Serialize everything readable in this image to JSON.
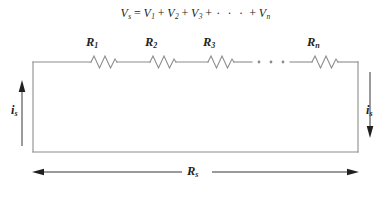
{
  "figure": {
    "kind": "series-resistor-circuit-diagram",
    "background_color": "#ffffff",
    "ink_color": "#231f20",
    "wire_color": "#8c8c8c"
  },
  "equation": {
    "lhs_symbol": "V",
    "lhs_subscript": "s",
    "equals": "=",
    "terms": [
      {
        "symbol": "V",
        "subscript": "1"
      },
      {
        "symbol": "V",
        "subscript": "2"
      },
      {
        "symbol": "V",
        "subscript": "3"
      }
    ],
    "plus": "+",
    "ellipsis": "· · ·",
    "last_term": {
      "symbol": "V",
      "subscript": "n"
    },
    "plain_text": "Vs = V1 + V2 + V3 + ··· + Vn"
  },
  "resistors": [
    {
      "id": "r1",
      "symbol": "R",
      "subscript": "1",
      "label_x": 86,
      "label_y": 35,
      "zigzag_center_x": 104
    },
    {
      "id": "r2",
      "symbol": "R",
      "subscript": "2",
      "label_x": 145,
      "label_y": 35,
      "zigzag_center_x": 163
    },
    {
      "id": "r3",
      "symbol": "R",
      "subscript": "3",
      "label_x": 203,
      "label_y": 35,
      "zigzag_center_x": 221
    },
    {
      "id": "rn",
      "symbol": "R",
      "subscript": "n",
      "label_x": 307,
      "label_y": 35,
      "zigzag_center_x": 325
    }
  ],
  "currents": [
    {
      "id": "i-left",
      "symbol": "i",
      "subscript": "s",
      "direction": "up",
      "label_x": 11,
      "label_y": 103
    },
    {
      "id": "i-right",
      "symbol": "i",
      "subscript": "s",
      "direction": "down",
      "label_x": 366,
      "label_y": 103
    }
  ],
  "total_resistance": {
    "symbol": "R",
    "subscript": "s",
    "label_x": 187,
    "label_y": 164,
    "dimension_arrow": "double-headed"
  },
  "loop": {
    "left_x": 33,
    "right_x": 358,
    "top_y": 62,
    "bottom_y": 152
  }
}
